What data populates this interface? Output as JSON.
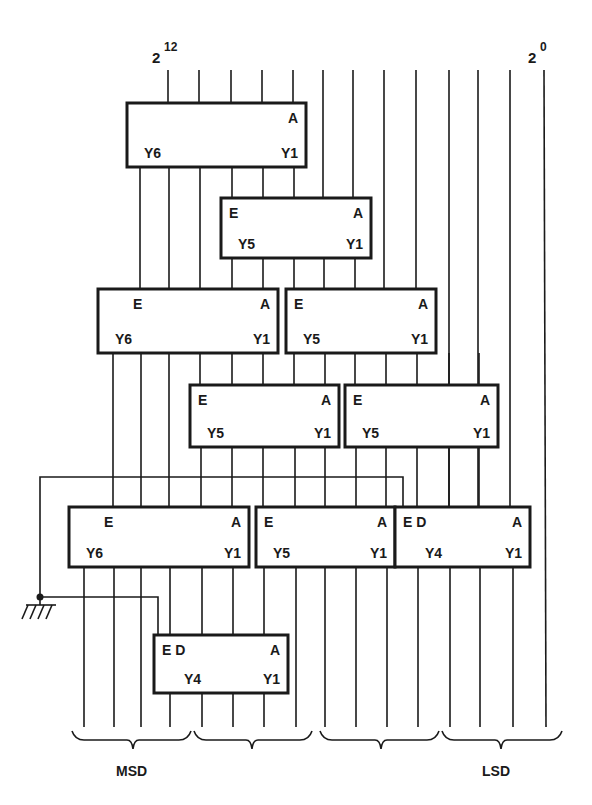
{
  "header": {
    "msb_label": {
      "base": "2",
      "exp": "12"
    },
    "lsb_label": {
      "base": "2",
      "exp": "0"
    }
  },
  "footer": {
    "msd_label": "MSD",
    "lsd_label": "LSD"
  },
  "colors": {
    "ink": "#1a1a1a",
    "background": "#ffffff"
  },
  "input_lines_x": [
    168,
    199,
    231,
    262,
    293,
    323,
    353,
    384,
    416,
    449,
    478,
    510,
    544
  ],
  "output_lines_x": [
    84,
    114,
    141,
    170,
    202,
    233,
    264,
    296,
    325,
    356,
    387,
    418,
    450,
    480,
    513,
    546
  ],
  "wires": [
    [
      [
        168,
        70
      ],
      [
        168,
        103
      ]
    ],
    [
      [
        199,
        70
      ],
      [
        199,
        103
      ]
    ],
    [
      [
        231,
        70
      ],
      [
        231,
        103
      ]
    ],
    [
      [
        262,
        70
      ],
      [
        262,
        103
      ]
    ],
    [
      [
        293,
        70
      ],
      [
        293,
        103
      ]
    ],
    [
      [
        323,
        70
      ],
      [
        323,
        198
      ]
    ],
    [
      [
        353,
        70
      ],
      [
        353,
        198
      ]
    ],
    [
      [
        384,
        70
      ],
      [
        384,
        289
      ]
    ],
    [
      [
        416,
        70
      ],
      [
        416,
        289
      ]
    ],
    [
      [
        449,
        70
      ],
      [
        449,
        507
      ]
    ],
    [
      [
        478,
        70
      ],
      [
        478,
        507
      ]
    ],
    [
      [
        510,
        70
      ],
      [
        510,
        507
      ]
    ],
    [
      [
        544,
        70
      ],
      [
        546,
        727
      ]
    ],
    [
      [
        140,
        167
      ],
      [
        140,
        289
      ]
    ],
    [
      [
        169,
        167
      ],
      [
        169,
        289
      ]
    ],
    [
      [
        200,
        167
      ],
      [
        200,
        289
      ]
    ],
    [
      [
        232,
        167
      ],
      [
        232,
        198
      ]
    ],
    [
      [
        263,
        167
      ],
      [
        263,
        198
      ]
    ],
    [
      [
        294,
        167
      ],
      [
        294,
        198
      ]
    ],
    [
      [
        232,
        258
      ],
      [
        232,
        289
      ]
    ],
    [
      [
        263,
        258
      ],
      [
        263,
        289
      ]
    ],
    [
      [
        294,
        258
      ],
      [
        294,
        289
      ]
    ],
    [
      [
        324,
        258
      ],
      [
        324,
        289
      ]
    ],
    [
      [
        355,
        258
      ],
      [
        355,
        289
      ]
    ],
    [
      [
        113,
        353
      ],
      [
        113,
        507
      ]
    ],
    [
      [
        141,
        353
      ],
      [
        141,
        507
      ]
    ],
    [
      [
        169,
        353
      ],
      [
        169,
        507
      ]
    ],
    [
      [
        200,
        353
      ],
      [
        200,
        385
      ]
    ],
    [
      [
        232,
        353
      ],
      [
        232,
        385
      ]
    ],
    [
      [
        263,
        353
      ],
      [
        263,
        385
      ]
    ],
    [
      [
        294,
        353
      ],
      [
        294,
        385
      ]
    ],
    [
      [
        325,
        353
      ],
      [
        325,
        385
      ]
    ],
    [
      [
        355,
        353
      ],
      [
        355,
        385
      ]
    ],
    [
      [
        386,
        353
      ],
      [
        386,
        385
      ]
    ],
    [
      [
        417,
        353
      ],
      [
        417,
        385
      ]
    ],
    [
      [
        449,
        353
      ],
      [
        449,
        507
      ]
    ],
    [
      [
        479,
        353
      ],
      [
        479,
        507
      ]
    ],
    [
      [
        201,
        447
      ],
      [
        201,
        507
      ]
    ],
    [
      [
        232,
        447
      ],
      [
        232,
        507
      ]
    ],
    [
      [
        263,
        447
      ],
      [
        263,
        507
      ]
    ],
    [
      [
        295,
        447
      ],
      [
        295,
        507
      ]
    ],
    [
      [
        325,
        447
      ],
      [
        325,
        507
      ]
    ],
    [
      [
        356,
        447
      ],
      [
        356,
        507
      ]
    ],
    [
      [
        386,
        447
      ],
      [
        386,
        507
      ]
    ],
    [
      [
        417,
        447
      ],
      [
        417,
        507
      ]
    ],
    [
      [
        84,
        567
      ],
      [
        84,
        727
      ]
    ],
    [
      [
        114,
        567
      ],
      [
        114,
        727
      ]
    ],
    [
      [
        141,
        567
      ],
      [
        141,
        727
      ]
    ],
    [
      [
        170,
        567
      ],
      [
        170,
        635
      ]
    ],
    [
      [
        202,
        567
      ],
      [
        202,
        635
      ]
    ],
    [
      [
        233,
        567
      ],
      [
        233,
        635
      ]
    ],
    [
      [
        264,
        567
      ],
      [
        264,
        635
      ]
    ],
    [
      [
        296,
        567
      ],
      [
        296,
        727
      ]
    ],
    [
      [
        325,
        567
      ],
      [
        325,
        727
      ]
    ],
    [
      [
        356,
        567
      ],
      [
        356,
        727
      ]
    ],
    [
      [
        387,
        567
      ],
      [
        387,
        727
      ]
    ],
    [
      [
        418,
        567
      ],
      [
        418,
        727
      ]
    ],
    [
      [
        450,
        567
      ],
      [
        450,
        727
      ]
    ],
    [
      [
        480,
        567
      ],
      [
        480,
        727
      ]
    ],
    [
      [
        513,
        567
      ],
      [
        513,
        727
      ]
    ],
    [
      [
        170,
        693
      ],
      [
        170,
        727
      ]
    ],
    [
      [
        202,
        693
      ],
      [
        202,
        727
      ]
    ],
    [
      [
        233,
        693
      ],
      [
        233,
        727
      ]
    ],
    [
      [
        264,
        693
      ],
      [
        264,
        727
      ]
    ],
    [
      [
        40,
        597
      ],
      [
        40,
        477
      ],
      [
        403,
        477
      ],
      [
        403,
        507
      ]
    ],
    [
      [
        40,
        597
      ],
      [
        158,
        597
      ],
      [
        158,
        635
      ]
    ],
    [
      [
        40,
        597
      ],
      [
        40,
        605
      ]
    ]
  ],
  "blocks": [
    {
      "id": "b1",
      "x": 127,
      "y": 103,
      "w": 179,
      "h": 64,
      "labels": {
        "tl": "",
        "tr": "A",
        "bl": "Y6",
        "br": "Y1"
      }
    },
    {
      "id": "b2",
      "x": 221,
      "y": 198,
      "w": 150,
      "h": 60,
      "labels": {
        "tl": "E",
        "tr": "A",
        "bl": "Y5",
        "br": "Y1"
      }
    },
    {
      "id": "b3",
      "x": 98,
      "y": 289,
      "w": 180,
      "h": 64,
      "labels": {
        "tl": "E",
        "tr": "A",
        "bl": "Y6",
        "br": "Y1"
      }
    },
    {
      "id": "b4",
      "x": 286,
      "y": 289,
      "w": 150,
      "h": 64,
      "labels": {
        "tl": "E",
        "tr": "A",
        "bl": "Y5",
        "br": "Y1"
      }
    },
    {
      "id": "b5",
      "x": 190,
      "y": 385,
      "w": 149,
      "h": 62,
      "labels": {
        "tl": "E",
        "tr": "A",
        "bl": "Y5",
        "br": "Y1"
      }
    },
    {
      "id": "b6",
      "x": 345,
      "y": 385,
      "w": 153,
      "h": 62,
      "labels": {
        "tl": "E",
        "tr": "A",
        "bl": "Y5",
        "br": "Y1"
      }
    },
    {
      "id": "b7",
      "x": 69,
      "y": 507,
      "w": 180,
      "h": 60,
      "labels": {
        "tl": "E",
        "tr": "A",
        "bl": "Y6",
        "br": "Y1"
      }
    },
    {
      "id": "b8",
      "x": 256,
      "y": 507,
      "w": 139,
      "h": 60,
      "labels": {
        "tl": "E",
        "tr": "A",
        "bl": "Y5",
        "br": "Y1"
      }
    },
    {
      "id": "b9",
      "x": 395,
      "y": 507,
      "w": 135,
      "h": 60,
      "labels": {
        "tl": "E D",
        "tr": "A",
        "bl": "Y4",
        "br": "Y1"
      }
    },
    {
      "id": "b10",
      "x": 154,
      "y": 635,
      "w": 134,
      "h": 58,
      "labels": {
        "tl": "E D",
        "tr": "A",
        "bl": "Y4",
        "br": "Y1"
      }
    }
  ],
  "ground": {
    "x": 40,
    "y": 597
  },
  "braces": [
    {
      "x1": 72,
      "x2": 191,
      "tip": 133
    },
    {
      "x1": 194,
      "x2": 312,
      "tip": 252
    },
    {
      "x1": 320,
      "x2": 439,
      "tip": 381
    },
    {
      "x1": 442,
      "x2": 562,
      "tip": 501
    }
  ]
}
